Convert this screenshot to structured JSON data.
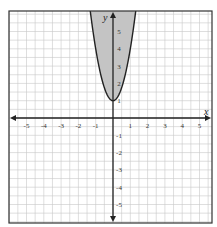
{
  "chart_data": {
    "type": "area",
    "title": "",
    "inequality": "y >= 3x^2 + 1",
    "curve": {
      "a": 3,
      "h": 0,
      "k": 1,
      "vertex": [
        0,
        1
      ],
      "style": "solid"
    },
    "shading": "inside (above) parabola",
    "xlabel": "x",
    "ylabel": "y",
    "xlim": [
      -6,
      5.7
    ],
    "ylim": [
      -6.1,
      6.2
    ],
    "x_ticks": [
      -5,
      -4,
      -3,
      -2,
      -1,
      1,
      2,
      3,
      4,
      5
    ],
    "x_tick_labels": [
      "-5",
      "-4",
      "-3",
      "-2",
      "-1",
      "1",
      "2",
      "3",
      "4",
      "5"
    ],
    "y_ticks": [
      5,
      4,
      3,
      2,
      1,
      -1,
      -2,
      -3,
      -4,
      -5
    ],
    "y_tick_labels": [
      "5",
      "4",
      "3",
      "2",
      "1",
      "-1",
      "-2",
      "-3",
      "-4",
      "-5"
    ],
    "grid": true,
    "grid_step": 0.5
  },
  "colors": {
    "grid": "#c8c8c8",
    "axis": "#222222",
    "frame": "#333333",
    "shade": "#c4c4c4",
    "curve": "#222222"
  }
}
